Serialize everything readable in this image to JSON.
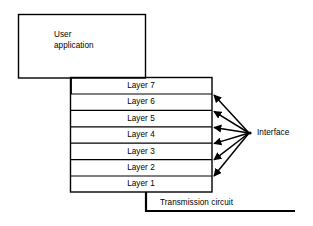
{
  "diagram": {
    "background_color": "#ffffff",
    "line_color": "#000000",
    "user_application": {
      "label_line1": "User",
      "label_line2": "application"
    },
    "layers": [
      {
        "label": "Layer 7"
      },
      {
        "label": "Layer 6"
      },
      {
        "label": "Layer 5"
      },
      {
        "label": "Layer 4"
      },
      {
        "label": "Layer 3"
      },
      {
        "label": "Layer 2"
      },
      {
        "label": "Layer 1"
      }
    ],
    "interface": {
      "label": "Interface",
      "arrow_count": 6
    },
    "transmission": {
      "label": "Transmission circuit"
    }
  }
}
